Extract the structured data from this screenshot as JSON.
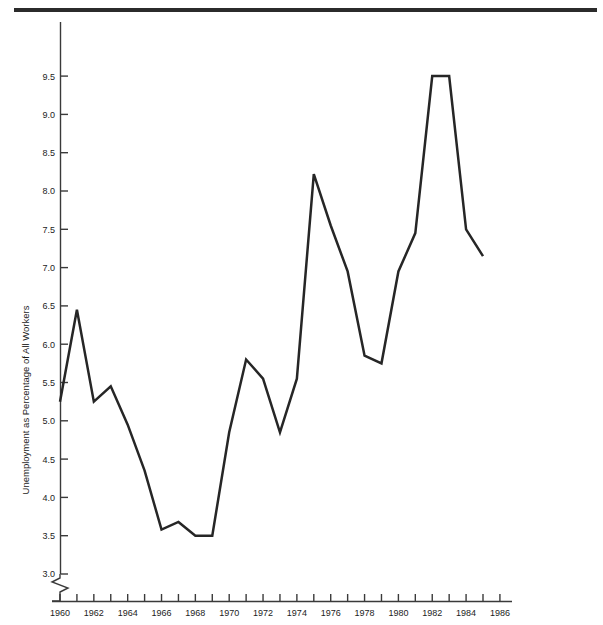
{
  "figure": {
    "background_color": "#ffffff",
    "rule_color": "#2b2b2b",
    "line_color": "#262626",
    "axis_color": "#3a3a3a"
  },
  "chart_data": {
    "type": "line",
    "title": "",
    "xlabel": "",
    "ylabel": "Unemployment as Percentage of All Workers",
    "xlim": [
      1960,
      1986
    ],
    "ylim": [
      3.0,
      9.75
    ],
    "grid": false,
    "legend": null,
    "axis_break": true,
    "axis_break_note": "y-axis broken below 3.0",
    "yticks": [
      "3.0",
      "3.5",
      "4.0",
      "4.5",
      "5.0",
      "5.5",
      "6.0",
      "6.5",
      "7.0",
      "7.5",
      "8.0",
      "8.5",
      "9.0",
      "9.5"
    ],
    "ytick_values": [
      3.0,
      3.5,
      4.0,
      4.5,
      5.0,
      5.5,
      6.0,
      6.5,
      7.0,
      7.5,
      8.0,
      8.5,
      9.0,
      9.5
    ],
    "xticks": [
      "1960",
      "1962",
      "1964",
      "1966",
      "1968",
      "1970",
      "1972",
      "1974",
      "1976",
      "1978",
      "1980",
      "1982",
      "1984",
      "1986"
    ],
    "xtick_values": [
      1960,
      1962,
      1964,
      1966,
      1968,
      1970,
      1972,
      1974,
      1976,
      1978,
      1980,
      1982,
      1984,
      1986
    ],
    "xtick_minor_values": [
      1961,
      1963,
      1965,
      1967,
      1969,
      1971,
      1973,
      1975,
      1977,
      1979,
      1981,
      1983,
      1985
    ],
    "x": [
      1960,
      1961,
      1962,
      1963,
      1964,
      1965,
      1966,
      1967,
      1968,
      1969,
      1970,
      1971,
      1972,
      1973,
      1974,
      1975,
      1976,
      1977,
      1978,
      1979,
      1980,
      1981,
      1982,
      1983,
      1984,
      1985
    ],
    "values": [
      5.25,
      6.45,
      5.25,
      5.45,
      4.95,
      4.35,
      3.58,
      3.68,
      3.5,
      3.5,
      4.85,
      5.8,
      5.55,
      4.85,
      5.55,
      8.22,
      7.55,
      6.95,
      5.85,
      5.75,
      6.95,
      7.45,
      9.5,
      9.5,
      7.5,
      7.15
    ],
    "series": [
      {
        "name": "Unemployment rate",
        "values": [
          5.25,
          6.45,
          5.25,
          5.45,
          4.95,
          4.35,
          3.58,
          3.68,
          3.5,
          3.5,
          4.85,
          5.8,
          5.55,
          4.85,
          5.55,
          8.22,
          7.55,
          6.95,
          5.85,
          5.75,
          6.95,
          7.45,
          9.5,
          9.5,
          7.5,
          7.15
        ]
      }
    ]
  }
}
